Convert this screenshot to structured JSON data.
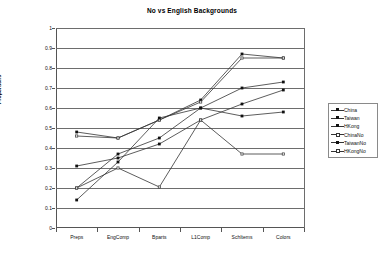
{
  "chart_data": {
    "type": "line",
    "title": "No vs English Backgrounds",
    "xlabel": "",
    "ylabel": "Proportions",
    "categories": [
      "Preps",
      "EngComp",
      "Bparts",
      "L1Comp",
      "SchItems",
      "Colors"
    ],
    "ylim": [
      0,
      1
    ],
    "ytick_labels": [
      "0",
      "0.1",
      "0.2",
      "0.3",
      "0.4",
      "0.5",
      "0.6",
      "0.7",
      "0.8",
      "0.9",
      "1"
    ],
    "ytick_values": [
      0,
      0.1,
      0.2,
      0.3,
      0.4,
      0.5,
      0.6,
      0.7,
      0.8,
      0.9,
      1
    ],
    "grid": true,
    "legend_position": "right",
    "series": [
      {
        "name": "China",
        "values": [
          0.48,
          0.45,
          0.54,
          0.64,
          0.87,
          0.85
        ]
      },
      {
        "name": "Taiwan",
        "values": [
          0.2,
          0.37,
          0.45,
          0.6,
          0.7,
          0.73
        ]
      },
      {
        "name": "HKong",
        "values": [
          0.31,
          0.35,
          0.42,
          0.54,
          0.62,
          0.69
        ]
      },
      {
        "name": "ChinaNo",
        "values": [
          0.46,
          0.45,
          0.54,
          0.63,
          0.85,
          0.85
        ]
      },
      {
        "name": "TaiwanNo",
        "values": [
          0.14,
          0.33,
          0.55,
          0.6,
          0.56,
          0.58
        ]
      },
      {
        "name": "HKongNo",
        "values": [
          0.2,
          0.3,
          0.205,
          0.54,
          0.37,
          0.37
        ]
      }
    ]
  },
  "legend": {
    "entries": [
      "China",
      "Taiwan",
      "HKong",
      "ChinaNo",
      "TaiwanNo",
      "HKongNo"
    ]
  }
}
